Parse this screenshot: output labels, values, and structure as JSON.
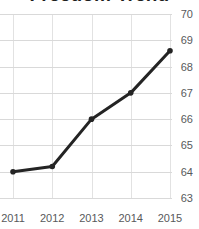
{
  "chart_data": {
    "type": "line",
    "title": "Freedom Trend",
    "x": [
      "2011",
      "2012",
      "2013",
      "2014",
      "2015"
    ],
    "series": [
      {
        "name": "freedom-score",
        "values": [
          64.0,
          64.2,
          66.0,
          67.0,
          68.6
        ]
      }
    ],
    "xlabel": "",
    "ylabel": "",
    "ylim": [
      63,
      70
    ],
    "yticks": [
      63,
      64,
      65,
      66,
      67,
      68,
      69,
      70
    ],
    "y_axis_side": "right",
    "grid": true,
    "legend": "none",
    "colors": {
      "line": "#242424",
      "marker": "#242424",
      "grid_horizontal": "#d9d9d9",
      "grid_vertical": "#e2e2e2",
      "tick_label": "#58595b",
      "title": "#1f1f1f",
      "background": "#ffffff"
    }
  }
}
